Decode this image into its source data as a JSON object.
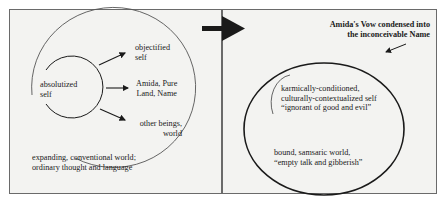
{
  "left_panel": {
    "center_label": [
      "absolutized",
      "self"
    ],
    "arrow_targets": [
      [
        "objectified",
        "self"
      ],
      [
        "Amida, Pure",
        "Land, Name"
      ],
      [
        "other beings,",
        "world"
      ]
    ],
    "outer_label": [
      "expanding, conventional world;",
      "ordinary thought and language"
    ]
  },
  "transition_arrow": {
    "direction": "right",
    "color": "#1a1a1a"
  },
  "right_panel": {
    "callout": [
      "Amida's Vow condensed into",
      "the inconceivable Name"
    ],
    "inner_label": [
      "karmically-conditioned,",
      "culturally-contextualized self",
      "“ignorant of good and evil”"
    ],
    "outer_label": [
      "bound, samsaric world,",
      "“empty talk and gibberish”"
    ]
  },
  "colors": {
    "panel_bg": "#f3f3f1",
    "border": "#6a6a6a",
    "ink": "#1a1a1a"
  }
}
